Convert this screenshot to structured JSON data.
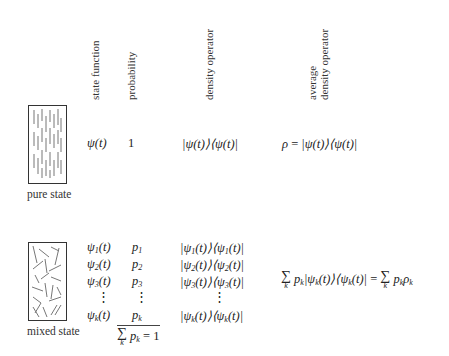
{
  "headers": {
    "state_function": "state function",
    "probability": "probability",
    "density_operator": "density operator",
    "average_line1": "average",
    "average_line2": "density operator"
  },
  "pure": {
    "label": "pure state",
    "state": "ψ(t)",
    "probability": "1",
    "density": "|ψ(t)⟩⟨ψ(t)|",
    "average_lhs": "ρ",
    "average_eq": "=",
    "average_rhs": "|ψ(t)⟩⟨ψ(t)|"
  },
  "mixed": {
    "label": "mixed state",
    "rows": [
      {
        "state_sym": "ψ",
        "sub": "1",
        "arg": "(t)",
        "p": "p",
        "psub": "1"
      },
      {
        "state_sym": "ψ",
        "sub": "2",
        "arg": "(t)",
        "p": "p",
        "psub": "2"
      },
      {
        "state_sym": "ψ",
        "sub": "3",
        "arg": "(t)",
        "p": "p",
        "psub": "3"
      },
      {
        "state_sym": "ψ",
        "sub": "k",
        "arg": "(t)",
        "p": "p",
        "psub": "k"
      }
    ],
    "ellipsis": "⋮",
    "normalization": {
      "sigma": "∑",
      "index": "k",
      "term": "p",
      "term_sub": "k",
      "rhs": "= 1"
    },
    "average": {
      "sigma": "∑",
      "index": "k",
      "lhs_p": "p",
      "lhs_p_sub": "k",
      "bra_ket": "|ψ",
      "bk_sub1": "k",
      "bk_mid": "(t)⟩⟨ψ",
      "bk_sub2": "k",
      "bk_end": "(t)|",
      "eq": "=",
      "rhs_p": "p",
      "rhs_p_sub": "k",
      "rhs_rho": "ρ",
      "rhs_rho_sub": "k"
    }
  }
}
